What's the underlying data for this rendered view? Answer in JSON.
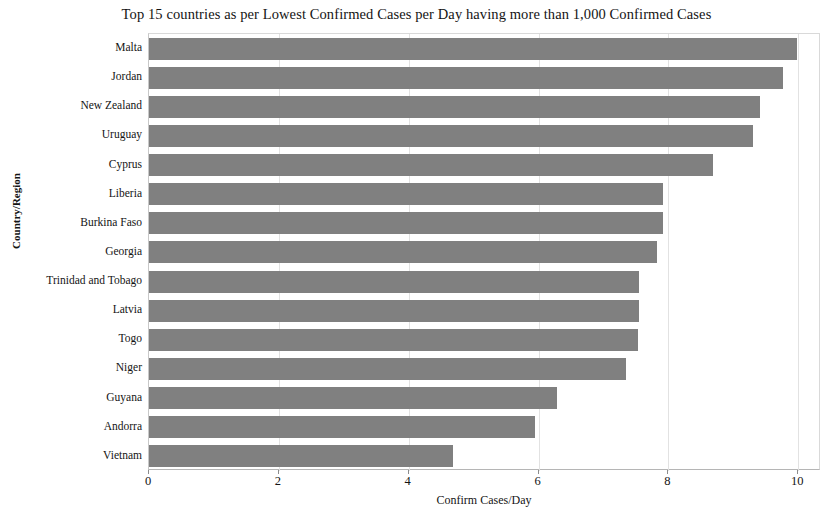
{
  "chart_data": {
    "type": "bar",
    "orientation": "horizontal",
    "title": "Top 15 countries as per Lowest Confirmed Cases per Day having more than 1,000 Confirmed Cases",
    "xlabel": "Confirm Cases/Day",
    "ylabel": "Country/Region",
    "categories": [
      "Malta",
      "Jordan",
      "New Zealand",
      "Uruguay",
      "Cyprus",
      "Liberia",
      "Burkina Faso",
      "Georgia",
      "Trinidad and Tobago",
      "Latvia",
      "Togo",
      "Niger",
      "Guyana",
      "Andorra",
      "Vietnam"
    ],
    "values": [
      9.98,
      9.77,
      9.41,
      9.3,
      8.68,
      7.92,
      7.92,
      7.83,
      7.55,
      7.55,
      7.53,
      7.34,
      6.28,
      5.95,
      4.68
    ],
    "xlim": [
      0,
      10.35
    ],
    "xticks": [
      0,
      2,
      4,
      6,
      8,
      10
    ],
    "xtick_labels": [
      "0",
      "2",
      "4",
      "6",
      "8",
      "10"
    ],
    "grid": "vertical",
    "legend": null,
    "bar_color": "#808080",
    "grid_color": "#e2e2e2",
    "background": "#ffffff"
  }
}
